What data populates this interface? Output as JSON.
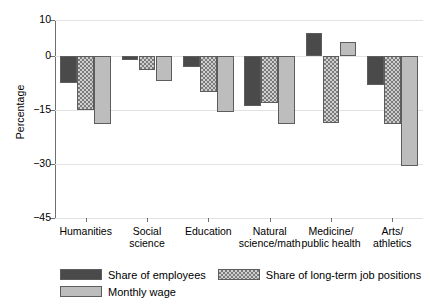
{
  "chart_data": {
    "type": "bar",
    "title": "",
    "subtitle": "",
    "xlabel": "",
    "ylabel": "Percentage",
    "ylim": [
      -45,
      10
    ],
    "yticks": [
      10,
      0,
      -15,
      -30,
      -45
    ],
    "ytick_labels": [
      "10",
      "0",
      "−15",
      "−30",
      "−45"
    ],
    "grid": true,
    "grid_axis": "y",
    "legend_position": "bottom-left",
    "categories": [
      "Humanities",
      "Social\nscience",
      "Education",
      "Natural\nscience/math",
      "Medicine/\npublic health",
      "Arts/\nathletics"
    ],
    "series": [
      {
        "name": "Share of employees",
        "color": "#4a4a4a",
        "pattern": "solid-dark",
        "values": [
          -7.5,
          -1.0,
          -3.0,
          -14.0,
          6.5,
          -8.0
        ]
      },
      {
        "name": "Share of long-term job positions",
        "color": "#cfcfcf",
        "pattern": "checkered",
        "values": [
          -15.0,
          -4.0,
          -10.0,
          -13.0,
          -18.5,
          -19.0
        ]
      },
      {
        "name": "Monthly wage",
        "color": "#bdbdbd",
        "pattern": "solid-light",
        "values": [
          -19.0,
          -7.0,
          -15.5,
          -19.0,
          4.0,
          -30.5
        ]
      }
    ]
  },
  "axis": {
    "y_title": "Percentage"
  }
}
